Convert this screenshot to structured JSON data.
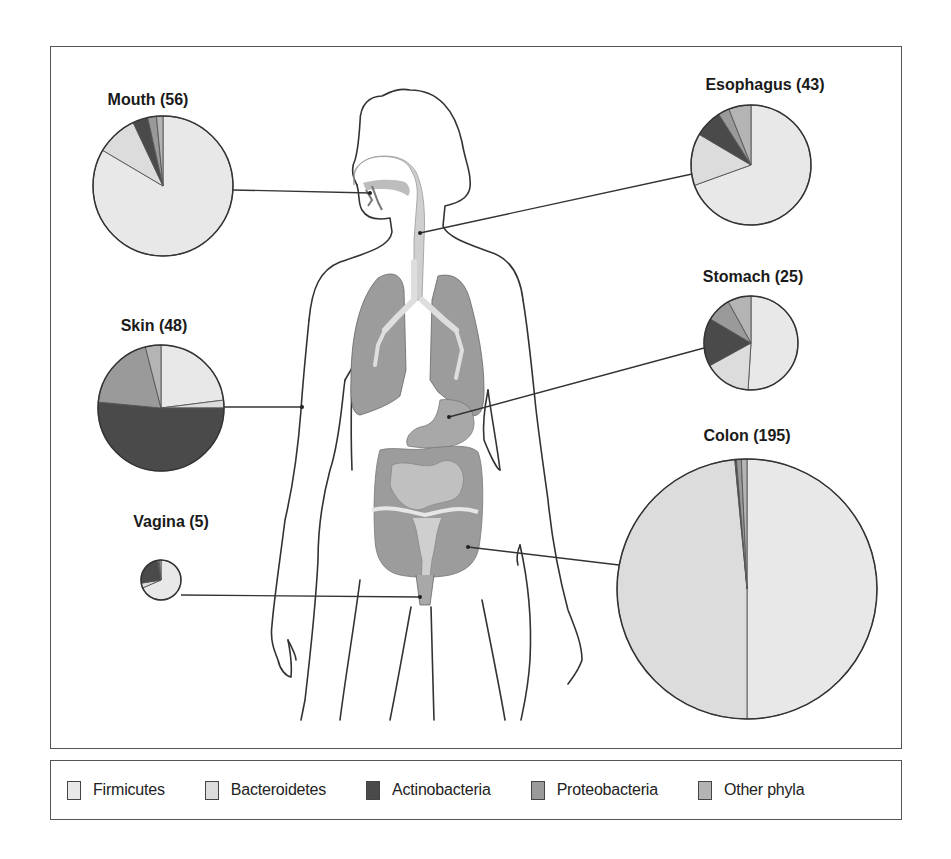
{
  "figure": {
    "type": "anatomical-pie-diagram"
  },
  "colors": {
    "Firmicutes": "#e8e8e8",
    "Bacteroidetes": "#dcdcdc",
    "Actinobacteria": "#4a4a4a",
    "Proteobacteria": "#9a9a9a",
    "Other phyla": "#b4b4b4",
    "organ_fill": "#9c9c9c",
    "organ_light": "#cfcfcf",
    "outline": "#333333"
  },
  "legend": {
    "items": [
      {
        "label": "Firmicutes",
        "color": "#e8e8e8"
      },
      {
        "label": "Bacteroidetes",
        "color": "#dcdcdc"
      },
      {
        "label": "Actinobacteria",
        "color": "#4a4a4a"
      },
      {
        "label": "Proteobacteria",
        "color": "#9a9a9a"
      },
      {
        "label": "Other phyla",
        "color": "#b4b4b4"
      }
    ]
  },
  "chart_data": {
    "type": "pie",
    "title": "",
    "legend_position": "bottom",
    "categories": [
      "Firmicutes",
      "Bacteroidetes",
      "Actinobacteria",
      "Proteobacteria",
      "Other phyla"
    ],
    "pies": [
      {
        "name": "Mouth",
        "label": "Mouth (56)",
        "n": 56,
        "cx": 163,
        "cy": 186,
        "r": 70,
        "title_x": 148,
        "title_y": 105,
        "target": [
          370,
          193
        ],
        "line_from": [
          233,
          190
        ],
        "values": [
          83.5,
          9.5,
          3.5,
          2.0,
          1.5
        ]
      },
      {
        "name": "Esophagus",
        "label": "Esophagus (43)",
        "n": 43,
        "cx": 751,
        "cy": 165,
        "r": 60,
        "title_x": 765,
        "title_y": 90,
        "target": [
          420,
          233
        ],
        "line_from": [
          692,
          174
        ],
        "values": [
          69.5,
          14.0,
          7.5,
          3.0,
          6.0
        ]
      },
      {
        "name": "Skin",
        "label": "Skin (48)",
        "n": 48,
        "cx": 161,
        "cy": 408,
        "r": 63,
        "title_x": 154,
        "title_y": 331,
        "target": [
          302,
          407
        ],
        "line_from": [
          224,
          407
        ],
        "values": [
          23.0,
          2.0,
          51.5,
          19.5,
          4.0
        ]
      },
      {
        "name": "Stomach",
        "label": "Stomach (25)",
        "n": 25,
        "cx": 751,
        "cy": 343,
        "r": 47,
        "title_x": 753,
        "title_y": 282,
        "target": [
          449,
          417
        ],
        "line_from": [
          704,
          348
        ],
        "values": [
          51.0,
          16.0,
          16.5,
          8.5,
          8.0
        ]
      },
      {
        "name": "Vagina",
        "label": "Vagina (5)",
        "n": 5,
        "cx": 161,
        "cy": 580,
        "r": 20,
        "title_x": 171,
        "title_y": 527,
        "target": [
          420,
          597
        ],
        "line_from": [
          181,
          595
        ],
        "values": [
          68.5,
          4.0,
          25.0,
          1.0,
          1.5
        ]
      },
      {
        "name": "Colon",
        "label": "Colon (195)",
        "n": 195,
        "cx": 747,
        "cy": 589,
        "r": 130,
        "title_x": 747,
        "title_y": 441,
        "target": [
          468,
          547
        ],
        "line_from": [
          619,
          565
        ],
        "values": [
          50.0,
          48.5,
          0.2,
          0.6,
          0.7
        ]
      }
    ]
  }
}
